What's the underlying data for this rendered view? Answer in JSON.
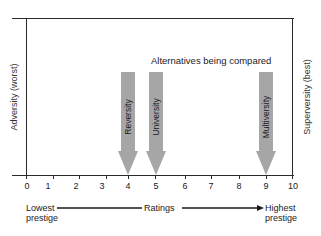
{
  "diagram": {
    "title": "Alternatives being compared",
    "left_label": "Adversity (worst)",
    "right_label": "Superversity (best)",
    "scale": {
      "min": 0,
      "max": 10,
      "ticks": [
        "0",
        "1",
        "2",
        "3",
        "4",
        "5",
        "6",
        "7",
        "8",
        "9",
        "10"
      ],
      "caption": "Ratings",
      "low_end_label_line1": "Lowest",
      "low_end_label_line2": "prestige",
      "high_end_label_line1": "Highest",
      "high_end_label_line2": "prestige"
    },
    "alternatives": [
      {
        "name": "Reversity",
        "rating": 4
      },
      {
        "name": "University",
        "rating": 5
      },
      {
        "name": "Multiversity",
        "rating": 9
      }
    ],
    "colors": {
      "arrow_fill": "#a6a6a6",
      "line": "#2a2a2a"
    }
  }
}
